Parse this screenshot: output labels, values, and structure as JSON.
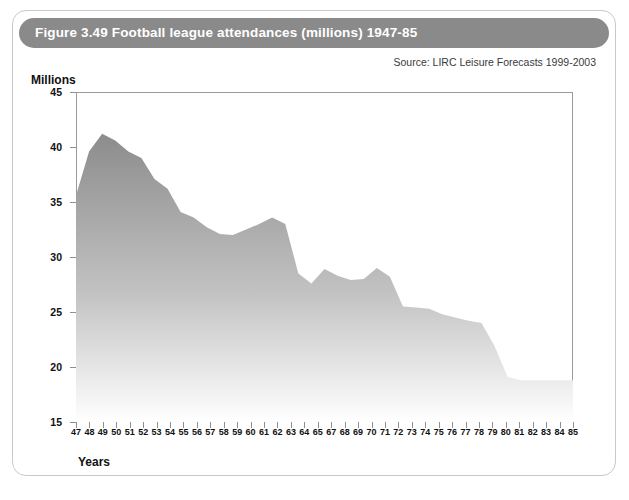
{
  "figure": {
    "title": "Figure 3.49 Football league attendances (millions) 1947-85",
    "source": "Source: LIRC Leisure Forecasts 1999-2003",
    "header_color": "#8a8a8a",
    "area_top_color": "#8c8c8c",
    "area_bottom_color": "#ffffff"
  },
  "chart_data": {
    "type": "area",
    "title": "Figure 3.49 Football league attendances (millions) 1947-85",
    "xlabel": "Years",
    "ylabel": "Millions",
    "xlim": [
      47,
      85
    ],
    "ylim": [
      15,
      45
    ],
    "grid": false,
    "legend": null,
    "y_ticks": [
      15,
      20,
      25,
      30,
      35,
      40,
      45
    ],
    "x_tick_labels": [
      "47",
      "48",
      "49",
      "50",
      "51",
      "52",
      "53",
      "54",
      "55",
      "56",
      "57",
      "58",
      "59",
      "60",
      "61",
      "62",
      "63",
      "64",
      "65",
      "67",
      "68",
      "69",
      "70",
      "71",
      "72",
      "73",
      "74",
      "75",
      "76",
      "77",
      "78",
      "79",
      "80",
      "81",
      "82",
      "83",
      "84",
      "85"
    ],
    "x": [
      47,
      48,
      49,
      50,
      51,
      52,
      53,
      54,
      55,
      56,
      57,
      58,
      59,
      60,
      61,
      62,
      63,
      64,
      65,
      66,
      67,
      68,
      69,
      70,
      71,
      72,
      73,
      74,
      75,
      76,
      77,
      78,
      79,
      80,
      81,
      82,
      83,
      84,
      85
    ],
    "values": [
      35.6,
      39.6,
      41.2,
      40.6,
      39.6,
      39.0,
      37.1,
      36.2,
      34.1,
      33.6,
      32.7,
      32.1,
      32.0,
      32.5,
      33.0,
      33.6,
      33.0,
      28.5,
      27.6,
      28.9,
      28.3,
      27.9,
      28.0,
      29.0,
      28.2,
      25.5,
      25.4,
      25.3,
      24.8,
      24.5,
      24.2,
      24.0,
      21.9,
      19.1,
      18.8,
      18.8,
      18.8,
      18.8,
      18.8
    ]
  },
  "axis": {
    "y_title": "Millions",
    "x_title": "Years"
  }
}
